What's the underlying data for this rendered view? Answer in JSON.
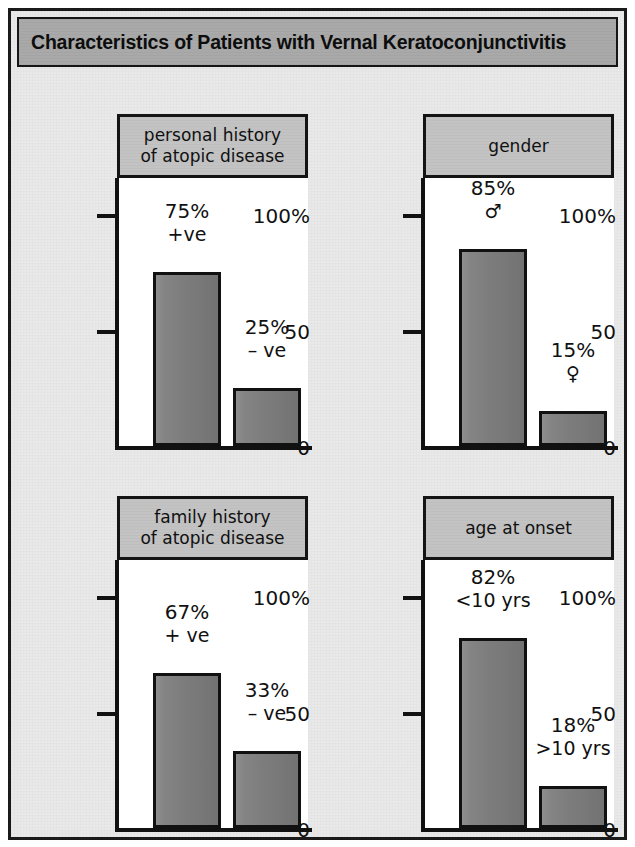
{
  "figure": {
    "title": "Characteristics of Patients with Vernal Keratoconjunctivitis",
    "title_bg": "#a9a9a9",
    "frame_border": "#1a1a1a",
    "background": "#e9e9e9",
    "bar_fill": "#7d7d7d",
    "header_bg": "#c3c3c3",
    "plot_bg": "#ffffff"
  },
  "axis": {
    "tick_100": "100%",
    "tick_50": "50",
    "tick_0": "0",
    "ylim_min": 0,
    "ylim_max": 100
  },
  "chart_data": {
    "type": "bar",
    "title": "Characteristics of Patients with Vernal Keratoconjunctivitis",
    "xlabel": "",
    "ylabel": "",
    "ylim": [
      0,
      100
    ],
    "ytick_labels": [
      "0",
      "50",
      "100%"
    ],
    "ytick_values": [
      0,
      50,
      100
    ],
    "grid": false,
    "legend": "none",
    "panels": [
      {
        "id": "personal-history",
        "title": "personal history\nof atopic disease",
        "categories": [
          "+ve",
          "– ve"
        ],
        "values": [
          75,
          25
        ],
        "bars": [
          {
            "value": 75,
            "value_label": "75%",
            "category_label": "+ve"
          },
          {
            "value": 25,
            "value_label": "25%",
            "category_label": "– ve"
          }
        ]
      },
      {
        "id": "gender",
        "title": "gender",
        "categories": [
          "♂",
          "♀"
        ],
        "values": [
          85,
          15
        ],
        "bars": [
          {
            "value": 85,
            "value_label": "85%",
            "category_label": "♂"
          },
          {
            "value": 15,
            "value_label": "15%",
            "category_label": "♀"
          }
        ]
      },
      {
        "id": "family-history",
        "title": "family history\nof atopic disease",
        "categories": [
          "+ ve",
          "– ve"
        ],
        "values": [
          67,
          33
        ],
        "bars": [
          {
            "value": 67,
            "value_label": "67%",
            "category_label": "+ ve"
          },
          {
            "value": 33,
            "value_label": "33%",
            "category_label": "– ve"
          }
        ]
      },
      {
        "id": "age-at-onset",
        "title": "age at onset",
        "categories": [
          "<10 yrs",
          ">10 yrs"
        ],
        "values": [
          82,
          18
        ],
        "bars": [
          {
            "value": 82,
            "value_label": "82%",
            "category_label": "<10 yrs"
          },
          {
            "value": 18,
            "value_label": "18%",
            "category_label": ">10 yrs"
          }
        ]
      }
    ]
  }
}
